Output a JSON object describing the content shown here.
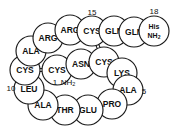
{
  "figure": {
    "background_color": "#ffffff",
    "outline_color": "#1a1a1a",
    "text_color": "#111111"
  },
  "chart_data": {
    "type": "diagram",
    "residues": [
      {
        "id": "r1",
        "label": "CYS",
        "number": "1",
        "number_pos": "below-left",
        "cx": 57,
        "cy": 70,
        "r": 15
      },
      {
        "id": "r2",
        "label": "ASN",
        "number": "",
        "number_pos": "",
        "cx": 81,
        "cy": 64,
        "r": 15
      },
      {
        "id": "r3",
        "label": "CYS",
        "number": "",
        "number_pos": "",
        "cx": 104,
        "cy": 62,
        "r": 15
      },
      {
        "id": "r4",
        "label": "LYS",
        "number": "",
        "number_pos": "",
        "cx": 122,
        "cy": 73,
        "r": 15
      },
      {
        "id": "r5",
        "label": "ALA",
        "number": "5",
        "number_pos": "right",
        "cx": 128,
        "cy": 90,
        "r": 15
      },
      {
        "id": "r6",
        "label": "PRO",
        "number": "",
        "number_pos": "",
        "cx": 112,
        "cy": 104,
        "r": 15
      },
      {
        "id": "r7",
        "label": "GLU",
        "number": "",
        "number_pos": "",
        "cx": 88,
        "cy": 110,
        "r": 15
      },
      {
        "id": "r8",
        "label": "THR",
        "number": "",
        "number_pos": "",
        "cx": 65,
        "cy": 110,
        "r": 15
      },
      {
        "id": "r9",
        "label": "ALA",
        "number": "",
        "number_pos": "",
        "cx": 43,
        "cy": 105,
        "r": 15
      },
      {
        "id": "r10",
        "label": "LEU",
        "number": "10",
        "number_pos": "left",
        "cx": 29,
        "cy": 89,
        "r": 15
      },
      {
        "id": "r11",
        "label": "CYS",
        "number": "",
        "number_pos": "",
        "cx": 25,
        "cy": 70,
        "r": 15
      },
      {
        "id": "r12",
        "label": "ALA",
        "number": "",
        "number_pos": "",
        "cx": 31,
        "cy": 51,
        "r": 15
      },
      {
        "id": "r13",
        "label": "ARG",
        "number": "",
        "number_pos": "",
        "cx": 48,
        "cy": 38,
        "r": 15
      },
      {
        "id": "r14",
        "label": "ARG",
        "number": "",
        "number_pos": "",
        "cx": 70,
        "cy": 30,
        "r": 15
      },
      {
        "id": "r15",
        "label": "CYS",
        "number": "15",
        "number_pos": "above",
        "cx": 92,
        "cy": 31,
        "r": 15
      },
      {
        "id": "r16",
        "label": "GLN",
        "number": "",
        "number_pos": "",
        "cx": 114,
        "cy": 31,
        "r": 15
      },
      {
        "id": "r17",
        "label": "GLN",
        "number": "",
        "number_pos": "",
        "cx": 134,
        "cy": 32,
        "r": 15
      },
      {
        "id": "r18",
        "label": "His",
        "label2": "NH2",
        "number": "18",
        "number_pos": "above",
        "cx": 154,
        "cy": 31,
        "r": 15
      }
    ],
    "backbone_bonds": [
      [
        "r1",
        "r2"
      ],
      [
        "r2",
        "r3"
      ],
      [
        "r3",
        "r4"
      ],
      [
        "r4",
        "r5"
      ],
      [
        "r5",
        "r6"
      ],
      [
        "r6",
        "r7"
      ],
      [
        "r7",
        "r8"
      ],
      [
        "r8",
        "r9"
      ],
      [
        "r9",
        "r10"
      ],
      [
        "r10",
        "r11"
      ],
      [
        "r11",
        "r12"
      ],
      [
        "r12",
        "r13"
      ],
      [
        "r13",
        "r14"
      ],
      [
        "r14",
        "r15"
      ],
      [
        "r15",
        "r16"
      ],
      [
        "r16",
        "r17"
      ],
      [
        "r17",
        "r18"
      ]
    ],
    "disulfide_bonds": [
      {
        "from": "r11",
        "to": "r1",
        "orientation": "horizontal"
      },
      {
        "from": "r15",
        "to": "r3",
        "orientation": "vertical"
      }
    ],
    "annotations": [
      {
        "id": "n-terminus",
        "text": "NH",
        "subscript": "2",
        "x": 68,
        "y": 82
      },
      {
        "id": "residue-1-num",
        "text": "1",
        "subscript": "",
        "x": 55,
        "y": 82
      },
      {
        "id": "residue-5-num",
        "text": "5",
        "subscript": "",
        "x": 144,
        "y": 91
      },
      {
        "id": "residue-10-num",
        "text": "10",
        "subscript": "",
        "x": 11,
        "y": 88
      },
      {
        "id": "residue-15-num",
        "text": "15",
        "subscript": "",
        "x": 92,
        "y": 12
      },
      {
        "id": "residue-18-num",
        "text": "18",
        "subscript": "",
        "x": 154,
        "y": 11
      }
    ]
  }
}
